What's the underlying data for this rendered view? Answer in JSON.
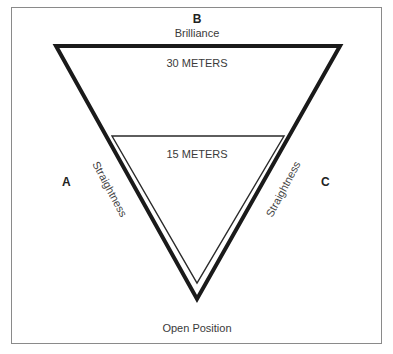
{
  "diagram": {
    "top_letter": "B",
    "top_label": "Brilliance",
    "outer_width_label": "30 METERS",
    "inner_width_label": "15 METERS",
    "left_letter": "A",
    "right_letter": "C",
    "left_side_label": "Straightness",
    "right_side_label": "Straightness",
    "bottom_label": "Open Position",
    "colors": {
      "frame": "#8a8a8a",
      "outer_triangle": "#1a1a1a",
      "inner_triangle": "#2a2a2a",
      "text": "#333333"
    }
  }
}
